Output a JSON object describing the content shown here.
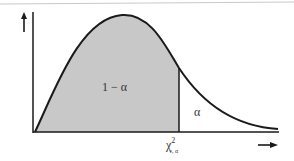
{
  "figure": {
    "title": "",
    "labels": {
      "acceptance_area": "1 − α",
      "rejection_area": "α",
      "critical_value_symbol": "χ",
      "critical_value_sup": "2",
      "critical_value_sub": "ν, α"
    },
    "axes": {
      "y_arrow": "up-arrow",
      "x_arrow": "right-arrow"
    },
    "colors": {
      "curve": "#1a1a1a",
      "shaded_fill": "#c8c8c8",
      "axis": "#1a1a1a",
      "background": "#ffffff"
    }
  }
}
